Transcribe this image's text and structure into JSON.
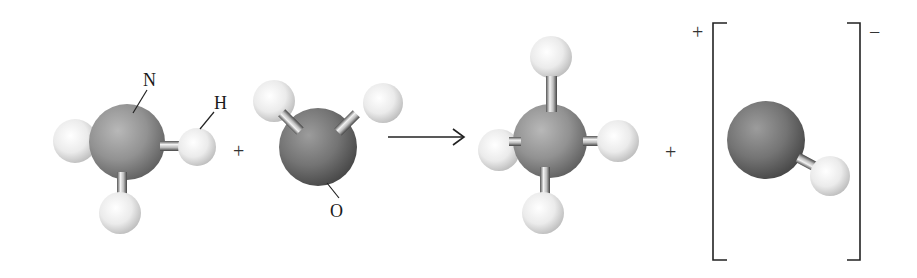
{
  "diagram": {
    "title": "",
    "equation": "NH3 + H2O -> NH4+ + OH-",
    "reactants": [
      {
        "id": "ammonia",
        "formula": "NH3",
        "central_atom": {
          "symbol": "N",
          "label": "N",
          "color": "#8c8c8c"
        },
        "hydrogens": 3,
        "h_label": "H"
      },
      {
        "id": "water",
        "formula": "H2O",
        "central_atom": {
          "symbol": "O",
          "label": "O",
          "color": "#6e6e6e"
        },
        "hydrogens": 2
      }
    ],
    "products": [
      {
        "id": "ammonium",
        "formula": "NH4+",
        "central_atom": {
          "symbol": "N",
          "color": "#8c8c8c"
        },
        "hydrogens": 4
      },
      {
        "id": "hydroxide",
        "formula": "OH-",
        "central_atom": {
          "symbol": "O",
          "color": "#6e6e6e"
        },
        "hydrogens": 1,
        "bracketed": true
      }
    ],
    "operators": {
      "plus_reactants": "+",
      "plus_products": "+",
      "arrow": "→"
    },
    "charges": {
      "ammonium_charge": "+",
      "hydroxide_charge": "−"
    },
    "labels": {
      "n": "N",
      "h": "H",
      "o": "O"
    },
    "colors": {
      "background": "#ffffff",
      "nitrogen": "#8c8c8c",
      "oxygen": "#6e6e6e",
      "hydrogen": "#ececec",
      "bond": "#9a9a9a",
      "text": "#1a1a1a"
    }
  }
}
